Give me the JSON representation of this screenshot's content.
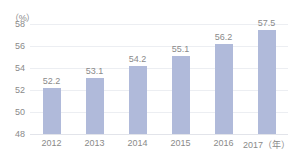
{
  "chart_data": {
    "type": "bar",
    "title": "",
    "subtitle": "",
    "xlabel": "（年）",
    "ylabel": "（%）",
    "unit_label": "（%）",
    "categories": [
      "2012",
      "2013",
      "2014",
      "2015",
      "2016",
      "2017"
    ],
    "x_tick_labels": [
      "2012",
      "2013",
      "2014",
      "2015",
      "2016",
      "2017（年）"
    ],
    "values": [
      52.2,
      53.1,
      54.2,
      55.1,
      56.2,
      57.5
    ],
    "value_labels": [
      "52.2",
      "53.1",
      "54.2",
      "55.1",
      "56.2",
      "57.5"
    ],
    "ylim": [
      48,
      58
    ],
    "y_ticks": [
      48,
      50,
      52,
      54,
      56,
      58
    ],
    "y_tick_labels": [
      "48",
      "50",
      "52",
      "54",
      "56",
      "58"
    ],
    "grid": true,
    "legend": false,
    "legend_position": "none",
    "series": [
      {
        "name": "",
        "values": [
          52.2,
          53.1,
          54.2,
          55.1,
          56.2,
          57.5
        ]
      }
    ]
  },
  "colors": {
    "bar": "#b0bada",
    "text": "#8a8a8a",
    "gridline": "#eceef2",
    "baseline": "#e2e4ea",
    "background": "#ffffff"
  }
}
